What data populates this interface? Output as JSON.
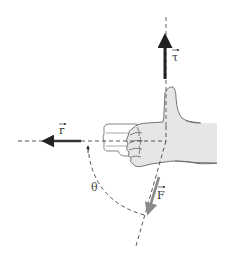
{
  "diagram": {
    "labels": {
      "torque": "τ",
      "position": "r",
      "force": "F",
      "angle": "θ"
    },
    "colors": {
      "background": "#ffffff",
      "torque_vector": "#222222",
      "position_vector": "#333333",
      "force_vector": "#8a8a8a",
      "hand_fill": "#e6e6e6",
      "hand_outline": "#666666",
      "dashed_lines": "#444444"
    }
  }
}
